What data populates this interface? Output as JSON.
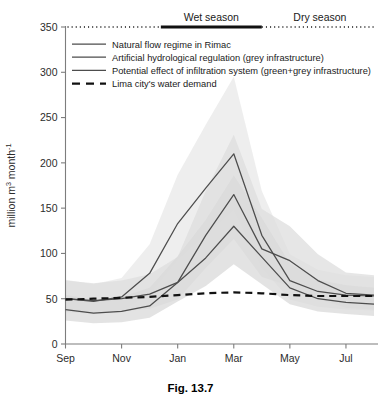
{
  "figure": {
    "caption": "Fig. 13.7"
  },
  "chart_data": {
    "type": "line",
    "title": "",
    "xlabel": "",
    "ylabel": "million m3 month-1",
    "ylabel_parts": {
      "prefix": "million m",
      "sup1": "3",
      "mid": " month",
      "sup2": "-1"
    },
    "x": [
      "Sep",
      "Oct",
      "Nov",
      "Dec",
      "Jan",
      "Feb",
      "Mar",
      "Apr",
      "May",
      "Jun",
      "Jul",
      "Aug"
    ],
    "xtick_labels": [
      "Sep",
      "Nov",
      "Jan",
      "Mar",
      "May",
      "Jul"
    ],
    "xtick_index": [
      0,
      2,
      4,
      6,
      8,
      10
    ],
    "ytick_labels": [
      "0",
      "50",
      "100",
      "150",
      "200",
      "250",
      "300",
      "350"
    ],
    "ytick_values": [
      0,
      50,
      100,
      150,
      200,
      250,
      300,
      350
    ],
    "ylim": [
      0,
      350
    ],
    "grid": false,
    "legend_position": "upper-left",
    "series": [
      {
        "name": "Natural flow regime in Rimac",
        "style": "solid",
        "color": "#4d4d4d",
        "values": [
          38,
          34,
          36,
          42,
          68,
          95,
          130,
          96,
          62,
          50,
          46,
          44
        ],
        "band_low": [
          26,
          23,
          24,
          29,
          47,
          64,
          88,
          66,
          44,
          36,
          33,
          31
        ],
        "band_high": [
          54,
          49,
          52,
          62,
          97,
          137,
          186,
          139,
          89,
          71,
          65,
          62
        ],
        "band_color": "#d9d9d9"
      },
      {
        "name": "Artificial hydrological regulation (grey infrastructure)",
        "style": "solid",
        "color": "#4d4d4d",
        "values": [
          50,
          48,
          50,
          55,
          68,
          120,
          165,
          105,
          92,
          70,
          56,
          54
        ],
        "band_low": [
          36,
          34,
          36,
          39,
          49,
          84,
          116,
          74,
          64,
          50,
          40,
          38
        ],
        "band_high": [
          70,
          67,
          70,
          77,
          96,
          169,
          231,
          149,
          130,
          99,
          79,
          76
        ],
        "band_color": "#dedede"
      },
      {
        "name": "Potential effect of infiltration system (green+grey infrastructure)",
        "style": "solid",
        "color": "#4d4d4d",
        "values": [
          50,
          47,
          52,
          78,
          133,
          172,
          210,
          120,
          70,
          58,
          54,
          53
        ],
        "band_low": [
          35,
          33,
          37,
          55,
          93,
          121,
          148,
          84,
          49,
          41,
          38,
          37
        ],
        "band_high": [
          71,
          66,
          73,
          110,
          187,
          242,
          295,
          169,
          99,
          82,
          76,
          74
        ],
        "band_color": "#e8e8e8"
      },
      {
        "name": "Lima city's water demand",
        "style": "dashed",
        "color": "#111111",
        "values": [
          49,
          50,
          51,
          52,
          54,
          56,
          57,
          56,
          54,
          53,
          53,
          53
        ]
      }
    ],
    "annotations": [
      {
        "label": "Wet season",
        "kind": "bar",
        "start_index": 3.4,
        "end_index": 7.0,
        "y": 350
      },
      {
        "label": "Dry season",
        "kind": "dotted",
        "start_index": 7.0,
        "end_index": 11.5,
        "y": 350
      }
    ]
  },
  "legend": {
    "items": [
      {
        "label": "Natural flow regime in Rimac",
        "style": "solid"
      },
      {
        "label": "Artificial hydrological regulation (grey infrastructure)",
        "style": "solid"
      },
      {
        "label": "Potential effect of infiltration system (green+grey infrastructure)",
        "style": "solid"
      },
      {
        "label": "Lima city's water demand",
        "style": "dashed"
      }
    ]
  }
}
